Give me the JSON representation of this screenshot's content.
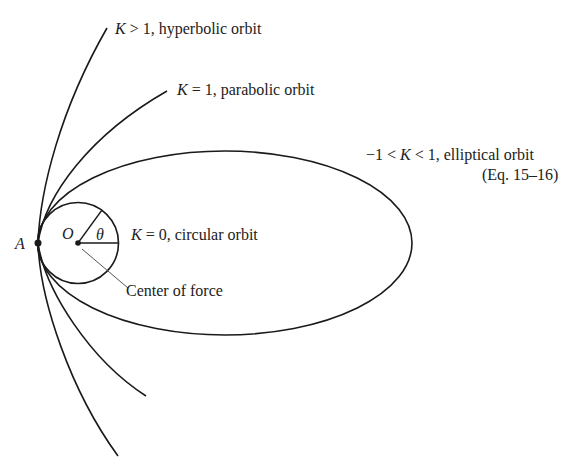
{
  "diagram": {
    "point_A": "A",
    "point_O": "O",
    "angle": "θ",
    "labels": {
      "hyperbolic": {
        "var": "K",
        "rel": " > 1, hyperbolic orbit"
      },
      "parabolic": {
        "var": "K",
        "rel": " = 1, parabolic orbit"
      },
      "elliptical": {
        "pre": "−1 < ",
        "var": "K",
        "rel": " < 1, elliptical orbit"
      },
      "elliptical_ref": "(Eq. 15–16)",
      "circular": {
        "var": "K",
        "rel": " = 0, circular orbit"
      },
      "center_of_force": "Center of force"
    },
    "colors": {
      "stroke": "#1a1a1a",
      "text": "#222222",
      "leader": "#555555"
    }
  }
}
